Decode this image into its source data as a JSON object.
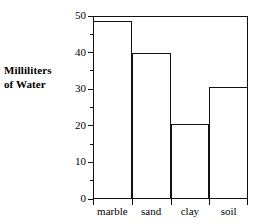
{
  "chart_data": {
    "type": "bar",
    "title": "",
    "xlabel": "",
    "ylabel": "Milliliters of Water",
    "ylabel_lines": [
      "Milliliters",
      "of Water"
    ],
    "categories": [
      "marble",
      "sand",
      "clay",
      "soil"
    ],
    "values": [
      48.5,
      40,
      20.5,
      30.5
    ],
    "ylim": [
      0,
      50
    ],
    "yticks": [
      0,
      10,
      20,
      30,
      40,
      50
    ],
    "ytick_labels": [
      "0",
      "10",
      "20",
      "30",
      "40",
      "50"
    ],
    "yminor_ticks": [
      5,
      15,
      25,
      35,
      45
    ],
    "grid": false,
    "legend": false,
    "bar_style": {
      "fill": "#ffffff",
      "edge": "#111111",
      "adjacent": true
    },
    "frame": {
      "top": true,
      "right": true,
      "bottom": true,
      "left": true,
      "color": "#111111"
    }
  },
  "figure": {
    "background": "#ffffff",
    "text_color": "#000000"
  }
}
